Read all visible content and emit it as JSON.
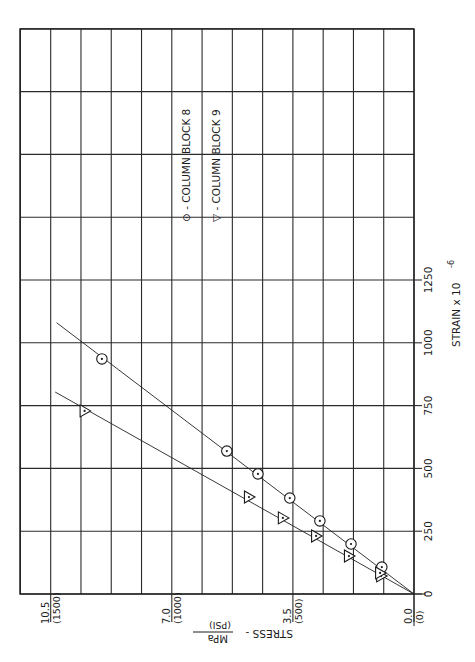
{
  "chart_data": {
    "type": "scatter",
    "orientation_note": "figure printed rotated 90 degrees counter-clockwise",
    "title": "",
    "xlabel": "STRAIN x 10^-6",
    "ylabel": "STRESS - MPa (PSI)",
    "xlim": [
      0,
      2250
    ],
    "ylim": [
      0,
      11.375
    ],
    "x_ticks": [
      0,
      250,
      500,
      750,
      1000,
      1250
    ],
    "x_tick_labels": [
      "0",
      "250",
      "500",
      "750",
      "1000",
      "1250"
    ],
    "y_ticks": [
      0.0,
      3.5,
      7.0,
      10.5
    ],
    "y_tick_labels": [
      {
        "mpa": "0.0",
        "psi": "(0)"
      },
      {
        "mpa": "3.5",
        "psi": "(500)"
      },
      {
        "mpa": "7.0",
        "psi": "(1000)"
      },
      {
        "mpa": "10.5",
        "psi": "(1500)"
      }
    ],
    "grid": true,
    "grid_x_step": 250,
    "grid_y_step": 0.875,
    "legend_position": "upper-middle (inside plot)",
    "series": [
      {
        "name": "COLUMN BLOCK 8",
        "marker": "circle",
        "legend_symbol": "⊙",
        "points": [
          {
            "strain": 107,
            "stress": 0.93
          },
          {
            "strain": 199,
            "stress": 1.82
          },
          {
            "strain": 291,
            "stress": 2.72
          },
          {
            "strain": 382,
            "stress": 3.59
          },
          {
            "strain": 478,
            "stress": 4.51
          },
          {
            "strain": 569,
            "stress": 5.41
          },
          {
            "strain": 936,
            "stress": 9.02
          }
        ],
        "fit_line": {
          "from": {
            "strain": 0,
            "stress": 0
          },
          "to": {
            "strain": 1080,
            "stress": 10.33
          }
        }
      },
      {
        "name": "COLUMN BLOCK 9",
        "marker": "triangle",
        "legend_symbol": "▽",
        "points": [
          {
            "strain": 72,
            "stress": 0.95
          },
          {
            "strain": 84,
            "stress": 0.98
          },
          {
            "strain": 151,
            "stress": 1.88
          },
          {
            "strain": 231,
            "stress": 2.83
          },
          {
            "strain": 303,
            "stress": 3.79
          },
          {
            "strain": 386,
            "stress": 4.77
          },
          {
            "strain": 729,
            "stress": 9.52
          }
        ],
        "fit_line": {
          "from": {
            "strain": 0,
            "stress": 0
          },
          "to": {
            "strain": 804,
            "stress": 10.37
          }
        }
      }
    ]
  },
  "labels": {
    "legend_8": "⊙ - COLUMN BLOCK 8",
    "legend_9": "▽ - COLUMN BLOCK 9",
    "x_axis_title": "STRAIN  x 10",
    "x_axis_exp": "-6",
    "y_axis_title": "STRESS  -",
    "y_axis_unit_top": "MPa",
    "y_axis_unit_bottom": "(PSI)"
  },
  "layout": {
    "origin_px": [
      414,
      594
    ],
    "px_per_strain_unit": 0.2512,
    "px_per_mpa": 34.6,
    "grid_left_px": 20,
    "grid_top_px": 29
  }
}
